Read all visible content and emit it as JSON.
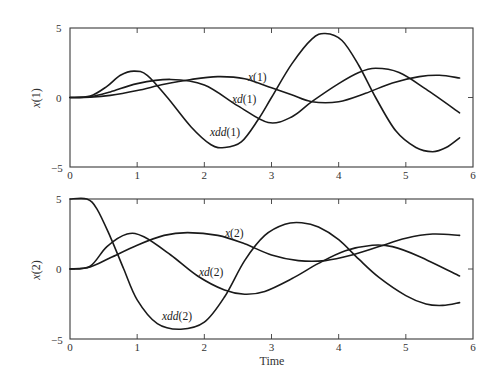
{
  "chart_data": [
    {
      "type": "line",
      "title": "",
      "xlabel": "",
      "ylabel": "x(1)",
      "xlim": [
        0,
        6
      ],
      "ylim": [
        -5,
        5
      ],
      "xticks": [
        "0",
        "1",
        "2",
        "3",
        "4",
        "5",
        "6"
      ],
      "yticks": [
        "-5",
        "0",
        "5"
      ],
      "grid": false,
      "legend": "inline labels",
      "series": [
        {
          "name": "x(1)",
          "label_var": "x",
          "label_idx": "(1)",
          "x": [
            0,
            0.3,
            0.6,
            1.0,
            1.4,
            1.8,
            2.2,
            2.6,
            3.0,
            3.3,
            3.6,
            4.0,
            4.4,
            4.8,
            5.2,
            5.5,
            5.8
          ],
          "y": [
            0,
            0.02,
            0.15,
            0.5,
            0.95,
            1.3,
            1.5,
            1.35,
            0.7,
            0.2,
            -0.3,
            -0.3,
            0.3,
            1.05,
            1.5,
            1.6,
            1.4
          ]
        },
        {
          "name": "xd(1)",
          "label_var": "xd",
          "label_idx": "(1)",
          "x": [
            0,
            0.3,
            0.6,
            1.0,
            1.5,
            2.0,
            2.5,
            2.95,
            3.3,
            3.6,
            4.0,
            4.3,
            4.55,
            4.9,
            5.3,
            5.8
          ],
          "y": [
            0,
            0.05,
            0.4,
            1.0,
            1.3,
            0.9,
            -0.6,
            -1.8,
            -1.4,
            -0.3,
            1.0,
            1.8,
            2.1,
            1.8,
            0.6,
            -1.1
          ]
        },
        {
          "name": "xdd(1)",
          "label_var": "xdd",
          "label_idx": "(1)",
          "x": [
            0,
            0.3,
            0.55,
            0.75,
            0.95,
            1.15,
            1.45,
            1.8,
            2.1,
            2.3,
            2.55,
            2.8,
            3.0,
            3.3,
            3.6,
            3.8,
            4.05,
            4.3,
            4.55,
            4.85,
            5.15,
            5.4,
            5.6,
            5.8
          ],
          "y": [
            0,
            0.1,
            0.8,
            1.6,
            1.9,
            1.6,
            0.0,
            -2.1,
            -3.4,
            -3.6,
            -3.2,
            -1.6,
            0.0,
            2.4,
            4.2,
            4.6,
            4.1,
            2.3,
            0.0,
            -2.4,
            -3.6,
            -3.9,
            -3.6,
            -2.9
          ]
        }
      ]
    },
    {
      "type": "line",
      "title": "",
      "xlabel": "Time",
      "ylabel": "x(2)",
      "xlim": [
        0,
        6
      ],
      "ylim": [
        -5,
        5
      ],
      "xticks": [
        "0",
        "1",
        "2",
        "3",
        "4",
        "5",
        "6"
      ],
      "yticks": [
        "-5",
        "0",
        "5"
      ],
      "grid": false,
      "legend": "inline labels",
      "series": [
        {
          "name": "x(2)",
          "label_var": "x",
          "label_idx": "(2)",
          "x": [
            0,
            0.3,
            0.6,
            1.0,
            1.4,
            1.75,
            2.2,
            2.6,
            3.0,
            3.4,
            3.8,
            4.2,
            4.6,
            5.0,
            5.4,
            5.8
          ],
          "y": [
            0,
            0.15,
            0.8,
            1.7,
            2.4,
            2.6,
            2.4,
            1.8,
            1.0,
            0.6,
            0.6,
            1.0,
            1.6,
            2.2,
            2.5,
            2.4
          ]
        },
        {
          "name": "xd(2)",
          "label_var": "xd",
          "label_idx": "(2)",
          "x": [
            0,
            0.3,
            0.55,
            0.85,
            1.1,
            1.5,
            1.9,
            2.3,
            2.6,
            2.9,
            3.3,
            3.7,
            4.1,
            4.5,
            4.8,
            5.2,
            5.8
          ],
          "y": [
            0,
            0.2,
            1.6,
            2.5,
            2.3,
            1.0,
            -0.5,
            -1.5,
            -1.8,
            -1.6,
            -0.7,
            0.4,
            1.3,
            1.7,
            1.6,
            0.9,
            -0.5
          ]
        },
        {
          "name": "xdd(2)",
          "label_var": "xdd",
          "label_idx": "(2)",
          "x": [
            0,
            0.25,
            0.4,
            0.6,
            0.8,
            1.0,
            1.3,
            1.65,
            2.0,
            2.3,
            2.6,
            2.9,
            3.2,
            3.45,
            3.7,
            4.0,
            4.3,
            4.6,
            5.0,
            5.3,
            5.55,
            5.8
          ],
          "y": [
            5,
            5,
            4.3,
            2.3,
            0.0,
            -2.2,
            -3.9,
            -4.3,
            -3.8,
            -2.0,
            0.6,
            2.4,
            3.2,
            3.3,
            3.0,
            2.1,
            0.7,
            -0.6,
            -1.9,
            -2.5,
            -2.6,
            -2.4
          ]
        }
      ]
    }
  ],
  "labels": {
    "top_ylabel": "x(1)",
    "bottom_ylabel": "x(2)",
    "xlabel": "Time",
    "ytick_top": "5",
    "ytick_mid": "0",
    "ytick_bot": "−5",
    "xticks": [
      "0",
      "1",
      "2",
      "3",
      "4",
      "5",
      "6"
    ]
  }
}
